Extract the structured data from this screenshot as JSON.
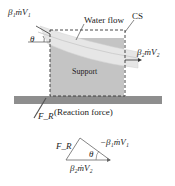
{
  "diagram": {
    "labels": {
      "inflow_momentum": "β₁ṁV₁",
      "outflow_momentum": "β₂ṁV₂",
      "water_flow": "Water flow",
      "control_surface": "CS",
      "angle": "θ",
      "support": "Support",
      "reaction_force_symbol": "F_R",
      "reaction_force_text": "(Reaction force)"
    },
    "vector_triangle": {
      "side_fr": "F_R",
      "side_neg_inflow": "−β₁ṁV₁",
      "side_outflow": "β₂ṁV₂",
      "angle": "θ"
    },
    "colors": {
      "support_fill": "#c4c4c4",
      "ground_fill": "#8e8e8e",
      "water_fill": "#e6e6e6",
      "dash": "#333333",
      "text": "#222222"
    }
  }
}
